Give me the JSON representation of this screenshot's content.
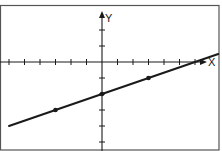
{
  "chart_data": {
    "type": "line",
    "title": "",
    "xlabel": "X",
    "ylabel": "Y",
    "xlim": [
      -6.5,
      7.5
    ],
    "ylim": [
      -5.5,
      4
    ],
    "grid": false,
    "legend": null,
    "x_ticks": [
      -6,
      -5,
      -4,
      -3,
      -2,
      -1,
      1,
      2,
      3,
      4,
      5,
      6
    ],
    "y_ticks": [
      -5,
      -4,
      -3,
      -2,
      -1,
      1,
      2
    ],
    "series": [
      {
        "name": "line",
        "equation": "y = x/3 - 2",
        "slope": 0.3333,
        "intercept": -2,
        "x_range": [
          -6,
          7.5
        ],
        "marked_points": [
          {
            "x": -3,
            "y": -3
          },
          {
            "x": 0,
            "y": -2
          },
          {
            "x": 3,
            "y": -1
          }
        ]
      }
    ]
  },
  "labels": {
    "x_axis": "X",
    "y_axis": "Y"
  },
  "colors": {
    "ink": "#1a1a1a",
    "frame": "#555555",
    "background": "#ffffff"
  }
}
